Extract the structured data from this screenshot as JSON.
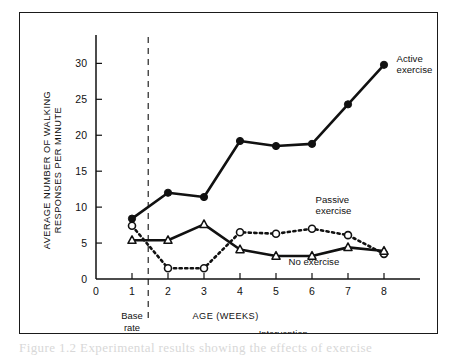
{
  "figure": {
    "caption_ghost": "Figure 1.2   Experimental results showing the effects of exercise"
  },
  "chart_data": {
    "type": "line",
    "title": "",
    "xlabel": "AGE (WEEKS)",
    "ylabel": "AVERAGE NUMBER OF WALKING RESPONSES PER MINUTE",
    "ylabel_line1": "AVERAGE NUMBER OF WALKING",
    "ylabel_line2": "RESPONSES PER MINUTE",
    "x": [
      1,
      2,
      3,
      4,
      5,
      6,
      7,
      8
    ],
    "xlim": [
      0,
      9
    ],
    "ylim": [
      0,
      32
    ],
    "xticks": [
      0,
      1,
      2,
      3,
      4,
      5,
      6,
      7,
      8
    ],
    "xtick_labels": [
      "0",
      "1",
      "2",
      "3",
      "4",
      "5",
      "6",
      "7",
      "8"
    ],
    "yticks": [
      0,
      5,
      10,
      15,
      20,
      25,
      30
    ],
    "ytick_labels": [
      "0",
      "5",
      "10",
      "15",
      "20",
      "25",
      "30"
    ],
    "grid": false,
    "legend_position": "inline-annotations",
    "series": [
      {
        "name": "Active exercise",
        "label_line1": "Active",
        "label_line2": "exercise",
        "marker": "filled-circle",
        "linestyle": "solid",
        "color": "#111111",
        "values": [
          8.4,
          12.0,
          11.4,
          19.2,
          18.5,
          18.8,
          24.3,
          29.8
        ]
      },
      {
        "name": "Passive exercise",
        "label_line1": "Passive",
        "label_line2": "exercise",
        "marker": "open-circle",
        "linestyle": "dotted",
        "color": "#111111",
        "values": [
          7.4,
          1.5,
          1.5,
          6.5,
          6.3,
          7.0,
          6.1,
          3.5
        ]
      },
      {
        "name": "No exercise",
        "label_line1": "No exercise",
        "label_line2": "",
        "marker": "open-triangle",
        "linestyle": "solid",
        "color": "#111111",
        "values": [
          5.4,
          5.4,
          7.6,
          4.1,
          3.2,
          3.2,
          4.4,
          3.9
        ]
      }
    ],
    "phase_divider_x": 1.45,
    "phases": [
      {
        "label_line1": "Base",
        "label_line2": "rate",
        "center_x": 1.0
      },
      {
        "label_line1": "Intervention",
        "label_line2": "",
        "center_x": 5.2
      }
    ],
    "annotations": [
      {
        "text_line1": "Active",
        "text_line2": "exercise",
        "x": 8.35,
        "y": 30.2
      },
      {
        "text_line1": "Passive",
        "text_line2": "exercise",
        "x": 6.1,
        "y": 10.6
      },
      {
        "text_line1": "No exercise",
        "text_line2": "",
        "x": 5.35,
        "y": 1.9
      }
    ]
  }
}
